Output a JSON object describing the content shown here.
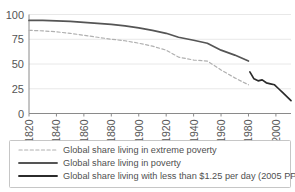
{
  "chart_data": {
    "type": "line",
    "title": "",
    "xlabel": "",
    "ylabel": "",
    "xlim": [
      1820,
      2011
    ],
    "ylim": [
      0,
      100
    ],
    "grid": true,
    "legend_position": "bottom",
    "xticks": [
      "1820",
      "1840",
      "1860",
      "1880",
      "1900",
      "1920",
      "1940",
      "1960",
      "1980",
      "2000"
    ],
    "xtick_values": [
      1820,
      1840,
      1860,
      1880,
      1900,
      1920,
      1940,
      1960,
      1980,
      2000
    ],
    "yticks": [
      "0",
      "25",
      "50",
      "75",
      "100"
    ],
    "ytick_values": [
      0,
      25,
      50,
      75,
      100
    ],
    "series": [
      {
        "name": "Global share living in extreme poverty",
        "style": "dashed",
        "color": "#b0b0b0",
        "x": [
          1820,
          1830,
          1840,
          1850,
          1860,
          1870,
          1880,
          1890,
          1900,
          1910,
          1920,
          1929,
          1940,
          1950,
          1960,
          1970,
          1980
        ],
        "values": [
          84,
          83.5,
          82.5,
          81,
          79,
          77,
          75,
          73.5,
          71,
          68,
          64,
          57,
          54,
          53,
          44,
          36,
          29
        ]
      },
      {
        "name": "Global share living in poverty",
        "style": "solid",
        "color": "#555555",
        "x": [
          1820,
          1830,
          1840,
          1850,
          1860,
          1870,
          1880,
          1890,
          1900,
          1910,
          1920,
          1929,
          1940,
          1950,
          1960,
          1970,
          1980
        ],
        "values": [
          94,
          94,
          93.5,
          93,
          92,
          91,
          90,
          88.5,
          86.5,
          84,
          81,
          77,
          74,
          71,
          64,
          59,
          53
        ]
      },
      {
        "name": "Global share living with less than $1.25 per day (2005 PPP)",
        "style": "solid",
        "color": "#2b2b2b",
        "x": [
          1981,
          1984,
          1987,
          1990,
          1993,
          1996,
          1999,
          2002,
          2005,
          2008,
          2011
        ],
        "values": [
          42,
          35,
          33,
          34,
          31,
          30,
          29,
          25,
          21,
          17,
          13
        ]
      }
    ]
  },
  "legend": {
    "items": [
      {
        "label": "Global share living in extreme poverty",
        "swatch": "dashed-line-light",
        "color": "#b0b0b0"
      },
      {
        "label": "Global share living in poverty",
        "swatch": "solid-line-medium",
        "color": "#555555"
      },
      {
        "label": "Global share living with less than $1.25 per day (2005 PPP)",
        "swatch": "solid-line-dark",
        "color": "#2b2b2b"
      }
    ]
  },
  "colors": {
    "grid": "#e2e2e2",
    "axis": "#8a8a8a",
    "text": "#4f4f4f",
    "background": "#ffffff",
    "legend_border": "#b8b8b8"
  }
}
